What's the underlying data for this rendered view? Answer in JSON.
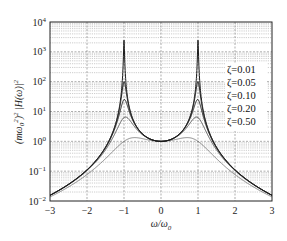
{
  "chart_data": {
    "type": "line",
    "title": "",
    "xlabel": "ω/ω0",
    "ylabel": "(mω0²)² |H(ω)|²",
    "xlim": [
      -3,
      3
    ],
    "ylim_log10": [
      -2,
      4
    ],
    "yscale": "log",
    "grid": true,
    "x_ticks": [
      "−3",
      "−2",
      "−1",
      "0",
      "1",
      "2",
      "3"
    ],
    "x_tick_values": [
      -3,
      -2,
      -1,
      0,
      1,
      2,
      3
    ],
    "y_ticks": [
      {
        "base": "10",
        "exp": "4"
      },
      {
        "base": "10",
        "exp": "3"
      },
      {
        "base": "10",
        "exp": "2"
      },
      {
        "base": "10",
        "exp": "1"
      },
      {
        "base": "10",
        "exp": "0"
      },
      {
        "base": "10",
        "exp": "−1"
      },
      {
        "base": "10",
        "exp": "−2"
      }
    ],
    "y_tick_exponents": [
      4,
      3,
      2,
      1,
      0,
      -1,
      -2
    ],
    "legend_position": "upper right (inside)",
    "formula": "1/((1-r^2)^2+(2ζr)^2), r=ω/ω0",
    "series": [
      {
        "name": "ζ=0.01",
        "zeta": 0.01,
        "peak_value": 2500,
        "value_at_0": 1,
        "value_at_3": 0.0156,
        "color": "#1a1a1a",
        "width": 1.0
      },
      {
        "name": "ζ=0.05",
        "zeta": 0.05,
        "peak_value": 100,
        "value_at_0": 1,
        "value_at_3": 0.0156,
        "color": "#1a1a1a",
        "width": 1.0
      },
      {
        "name": "ζ=0.10",
        "zeta": 0.1,
        "peak_value": 25,
        "value_at_0": 1,
        "value_at_3": 0.0155,
        "color": "#1a1a1a",
        "width": 1.0
      },
      {
        "name": "ζ=0.20",
        "zeta": 0.2,
        "peak_value": 6.25,
        "value_at_0": 1,
        "value_at_3": 0.0152,
        "color": "#333333",
        "width": 0.8
      },
      {
        "name": "ζ=0.50",
        "zeta": 0.5,
        "peak_value": 1.15,
        "value_at_0": 1,
        "value_at_3": 0.0137,
        "color": "#555555",
        "width": 0.7
      }
    ]
  },
  "labels": {
    "xlabel_main": "ω/ω",
    "xlabel_sub": "0",
    "ylabel_prefix": "(mω",
    "ylabel_sub": "0",
    "ylabel_sup1": "2",
    "ylabel_mid": ")",
    "ylabel_sup2": "2",
    "ylabel_suffix": " |H(ω)|",
    "ylabel_sup3": "2"
  },
  "layout": {
    "plot": {
      "left": 50,
      "top": 22,
      "right": 272,
      "bottom": 201
    }
  }
}
